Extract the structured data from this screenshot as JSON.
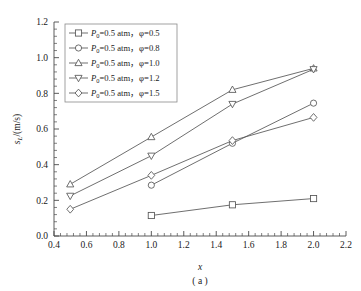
{
  "chart_data": {
    "type": "line",
    "title": "",
    "xlabel": "x",
    "ylabel": "s_L/(m/s)",
    "caption": "( a )",
    "xlim": [
      0.4,
      2.2
    ],
    "ylim": [
      0.0,
      1.2
    ],
    "xticks": [
      "0.4",
      "0.6",
      "0.8",
      "1.0",
      "1.2",
      "1.4",
      "1.6",
      "1.8",
      "2.0",
      "2.2"
    ],
    "xtick_values": [
      0.4,
      0.6,
      0.8,
      1.0,
      1.2,
      1.4,
      1.6,
      1.8,
      2.0,
      2.2
    ],
    "yticks": [
      "0.0",
      "0.2",
      "0.4",
      "0.6",
      "0.8",
      "1.0",
      "1.2"
    ],
    "ytick_values": [
      0.0,
      0.2,
      0.4,
      0.6,
      0.8,
      1.0,
      1.2
    ],
    "grid": false,
    "legend_position": "upper-left",
    "series": [
      {
        "name": "P0=0.5 atm, phi=0.5",
        "legend_label": "P",
        "legend_sub": "0",
        "legend_mid": "=0.5 atm，",
        "legend_phi": "φ",
        "legend_val": "=0.5",
        "marker": "square",
        "x": [
          1.0,
          1.5,
          2.0
        ],
        "values": [
          0.115,
          0.175,
          0.21
        ]
      },
      {
        "name": "P0=0.5 atm, phi=0.8",
        "legend_label": "P",
        "legend_sub": "0",
        "legend_mid": "=0.5 atm，",
        "legend_phi": "φ",
        "legend_val": "=0.8",
        "marker": "circle",
        "x": [
          1.0,
          1.5,
          2.0
        ],
        "values": [
          0.285,
          0.52,
          0.745
        ]
      },
      {
        "name": "P0=0.5 atm, phi=1.0",
        "legend_label": "P",
        "legend_sub": "0",
        "legend_mid": "=0.5 atm，",
        "legend_phi": "φ",
        "legend_val": "=1.0",
        "marker": "triangle-up",
        "x": [
          0.5,
          1.0,
          1.5,
          2.0
        ],
        "values": [
          0.29,
          0.555,
          0.82,
          0.94
        ]
      },
      {
        "name": "P0=0.5 atm, phi=1.2",
        "legend_label": "P",
        "legend_sub": "0",
        "legend_mid": "=0.5 atm，",
        "legend_phi": "φ",
        "legend_val": "=1.2",
        "marker": "triangle-down",
        "x": [
          0.5,
          1.0,
          1.5,
          2.0
        ],
        "values": [
          0.225,
          0.45,
          0.74,
          0.935
        ]
      },
      {
        "name": "P0=0.5 atm, phi=1.5",
        "legend_label": "P",
        "legend_sub": "0",
        "legend_mid": "=0.5 atm，",
        "legend_phi": "φ",
        "legend_val": "=1.5",
        "marker": "diamond",
        "x": [
          0.5,
          1.0,
          1.5,
          2.0
        ],
        "values": [
          0.15,
          0.34,
          0.535,
          0.665
        ]
      }
    ],
    "colors": {
      "line": "#555555",
      "marker_fill": "#ffffff",
      "axis": "#4a4a4a",
      "legend_border": "#8a8a8a",
      "text": "#1a1a1a",
      "background": "#ffffff"
    }
  },
  "ylabel_parts": {
    "main": "s",
    "sub": "L",
    "unit": "/(m/s)"
  }
}
